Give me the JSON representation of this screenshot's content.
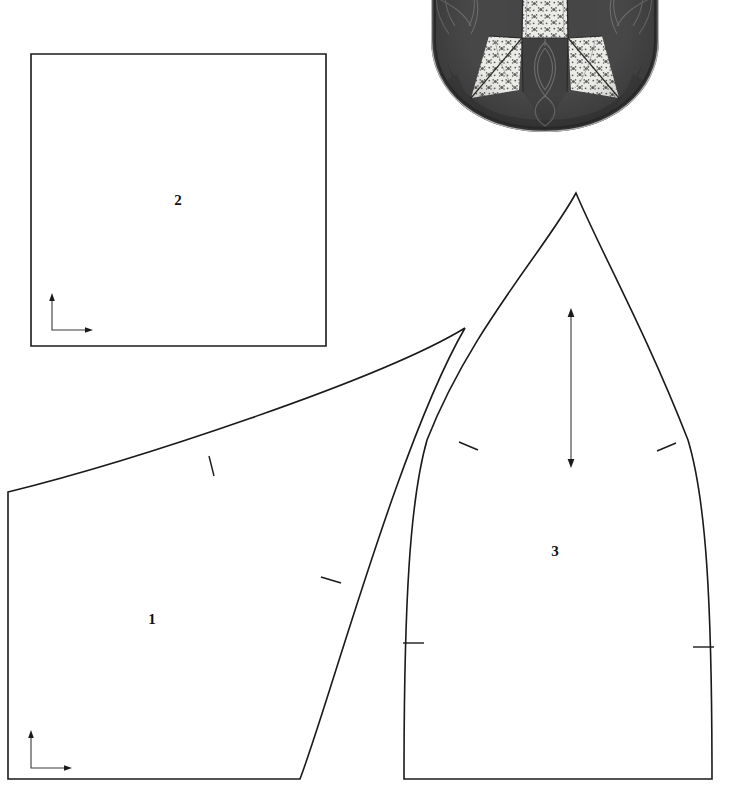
{
  "document": {
    "kind": "sewing-pattern-sheet",
    "width": 731,
    "height": 806,
    "background_color": "#ffffff",
    "line_color": "#1a1a1a"
  },
  "pieces": [
    {
      "id": "piece-1",
      "number_label": "1",
      "label_x": 152,
      "label_y": 621,
      "description": "large lower-left panel, cut off at left and bottom page edges, curved top and curved right side",
      "outline_path": "M 8 492 L 8 779 L 300 779 C 330 700 400 440 465 328 C 380 380 130 462 8 492 Z",
      "grain_marker": {
        "type": "L-shaped corner arrows",
        "corner_x": 31,
        "corner_y": 768,
        "vertical_top_y": 733,
        "horizontal_right_x": 70
      },
      "notches": [
        {
          "x1": 209,
          "y1": 456,
          "x2": 214,
          "y2": 475
        },
        {
          "x1": 322,
          "y1": 577,
          "x2": 340,
          "y2": 583
        }
      ]
    },
    {
      "id": "piece-2",
      "number_label": "2",
      "label_x": 178,
      "label_y": 202,
      "description": "plain square panel with straight edges",
      "outline_path": "M 31 54 L 326 54 L 326 346 L 31 346 Z",
      "grain_marker": {
        "type": "L-shaped corner arrows",
        "corner_x": 52,
        "corner_y": 330,
        "vertical_top_y": 296,
        "horizontal_right_x": 90
      },
      "notches": []
    },
    {
      "id": "piece-3",
      "number_label": "3",
      "label_x": 555,
      "label_y": 553,
      "description": "tall pointed dome-shaped panel, flat bottom, curved sides meeting at an apex",
      "outline_path": "M 576 193 C 545 250 470 330 427 440 C 410 500 404 600 404 779 L 712 779 C 712 600 706 500 688 440 C 645 330 600 250 576 193 Z",
      "grain_marker": {
        "type": "double-headed vertical arrow",
        "x": 571,
        "top_y": 311,
        "bottom_y": 465
      },
      "notches": [
        {
          "x1": 459,
          "y1": 443,
          "x2": 477,
          "y2": 450
        },
        {
          "x1": 658,
          "y1": 450,
          "x2": 676,
          "y2": 443
        },
        {
          "x1": 404,
          "y1": 643,
          "x2": 424,
          "y2": 643
        },
        {
          "x1": 694,
          "y1": 647,
          "x2": 714,
          "y2": 647
        }
      ]
    }
  ],
  "photo": {
    "id": "quilt-photo",
    "description": "black and white photograph of a round quilted pincushion top with dark solid wedges and light floral print patchwork cross",
    "x": 427,
    "y": 0,
    "width": 236,
    "height": 134,
    "dark_fabric_color": "#4a4a4a",
    "darker_shadow_color": "#3a3a3a",
    "light_print_color": "#e8e8e6",
    "print_motif_color": "#5a5a5a",
    "stitch_line_color": "#6e6e6e"
  }
}
